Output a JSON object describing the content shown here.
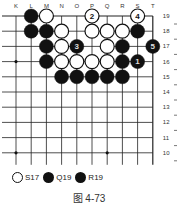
{
  "board": {
    "columns": [
      "K",
      "L",
      "M",
      "N",
      "O",
      "P",
      "Q",
      "R",
      "S",
      "T"
    ],
    "rows": [
      "19",
      "18",
      "17",
      "16",
      "15",
      "14",
      "13",
      "12",
      "11",
      "10"
    ],
    "star_points": [
      "K16",
      "K10",
      "Q10"
    ],
    "stones": [
      {
        "pos": "L19",
        "color": "black"
      },
      {
        "pos": "M19",
        "color": "white"
      },
      {
        "pos": "P19",
        "color": "white",
        "label": "2"
      },
      {
        "pos": "S19",
        "color": "white",
        "label": "4"
      },
      {
        "pos": "L18",
        "color": "black"
      },
      {
        "pos": "M18",
        "color": "black"
      },
      {
        "pos": "N18",
        "color": "white"
      },
      {
        "pos": "P18",
        "color": "white"
      },
      {
        "pos": "Q18",
        "color": "white"
      },
      {
        "pos": "R18",
        "color": "white"
      },
      {
        "pos": "S18",
        "color": "black"
      },
      {
        "pos": "M17",
        "color": "black"
      },
      {
        "pos": "N17",
        "color": "white"
      },
      {
        "pos": "O17",
        "color": "black",
        "label": "3"
      },
      {
        "pos": "Q17",
        "color": "white"
      },
      {
        "pos": "R17",
        "color": "black"
      },
      {
        "pos": "T17",
        "color": "black",
        "label": "5"
      },
      {
        "pos": "M16",
        "color": "black"
      },
      {
        "pos": "N16",
        "color": "white"
      },
      {
        "pos": "O16",
        "color": "white"
      },
      {
        "pos": "P16",
        "color": "white"
      },
      {
        "pos": "Q16",
        "color": "white"
      },
      {
        "pos": "R16",
        "color": "black"
      },
      {
        "pos": "S16",
        "color": "black",
        "label": "1"
      },
      {
        "pos": "N15",
        "color": "black"
      },
      {
        "pos": "O15",
        "color": "black"
      },
      {
        "pos": "P15",
        "color": "black"
      },
      {
        "pos": "Q15",
        "color": "black"
      },
      {
        "pos": "R15",
        "color": "black"
      }
    ]
  },
  "legend": [
    {
      "color": "white",
      "label": "S17"
    },
    {
      "color": "black",
      "label": "Q19"
    },
    {
      "color": "black",
      "label": "R19"
    }
  ],
  "caption": "图 4-73"
}
